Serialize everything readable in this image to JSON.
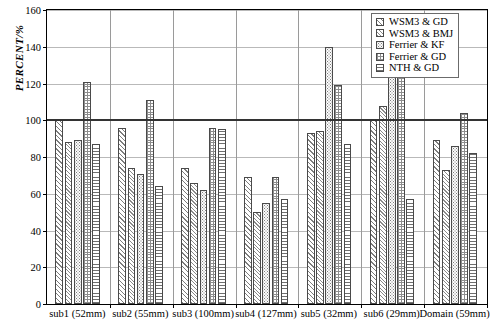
{
  "chart_data": {
    "type": "bar",
    "title": "",
    "xlabel": "",
    "ylabel": "PERCENT/%",
    "ylim": [
      0,
      160
    ],
    "ytick_values": [
      0,
      20,
      40,
      60,
      80,
      100,
      120,
      140,
      160
    ],
    "ytick_labels": [
      "0",
      "20",
      "40",
      "60",
      "80",
      "100",
      "120",
      "140",
      "160"
    ],
    "grid": true,
    "reference_line": 100,
    "legend_position": "top-right",
    "categories": [
      "sub1 (52mm)",
      "sub2 (55mm)",
      "sub3 (100mm)",
      "sub4 (127mm)",
      "sub5 (32mm)",
      "sub6 (29mm)",
      "Domain (59mm)"
    ],
    "series": [
      {
        "name": "WSM3 & GD",
        "pattern": "diagonal-hatch",
        "values": [
          100,
          96,
          74,
          69,
          93,
          100,
          89
        ]
      },
      {
        "name": "WSM3 & BMJ",
        "pattern": "diagonal-hatch",
        "values": [
          88,
          74,
          66,
          50,
          94,
          108,
          73
        ]
      },
      {
        "name": "Ferrier & KF",
        "pattern": "dotted",
        "values": [
          89,
          71,
          62,
          55,
          140,
          138,
          86
        ]
      },
      {
        "name": "Ferrier & GD",
        "pattern": "checkered",
        "values": [
          121,
          111,
          96,
          69,
          119,
          126,
          104
        ]
      },
      {
        "name": "NTH & GD",
        "pattern": "horizontal-lines",
        "values": [
          87,
          64,
          95,
          57,
          87,
          57,
          82
        ]
      }
    ]
  },
  "legend": {
    "items": [
      {
        "label": "WSM3 & GD"
      },
      {
        "label": "WSM3 & BMJ"
      },
      {
        "label": "Ferrier & KF"
      },
      {
        "label": "Ferrier & GD"
      },
      {
        "label": "NTH & GD"
      }
    ]
  }
}
